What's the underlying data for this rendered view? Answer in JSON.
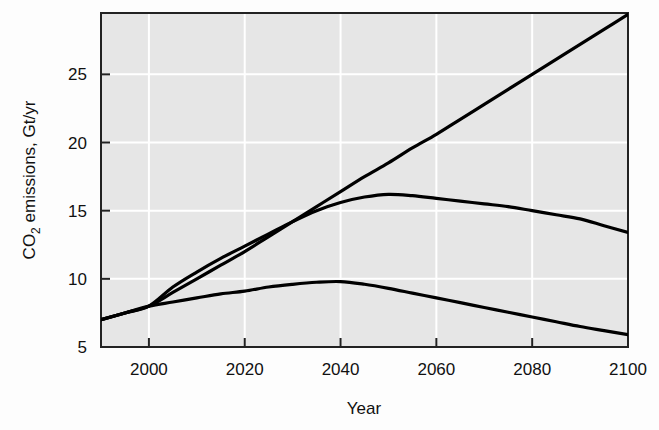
{
  "chart_data": {
    "type": "line",
    "title": "",
    "xlabel": "Year",
    "ylabel": "CO2 emissions, Gt/yr",
    "ylabel_parts": {
      "prefix": "CO",
      "subscript": "2",
      "suffix": " emissions, Gt/yr"
    },
    "xlim": [
      1990,
      2100
    ],
    "ylim": [
      5,
      29.5
    ],
    "xticks": [
      2000,
      2020,
      2040,
      2060,
      2080,
      2100
    ],
    "yticks": [
      5,
      10,
      15,
      20,
      25
    ],
    "xtick_labels": [
      "2000",
      "2020",
      "2040",
      "2060",
      "2080",
      "2100"
    ],
    "ytick_labels": [
      "5",
      "10",
      "15",
      "20",
      "25"
    ],
    "grid": true,
    "grid_color": "#ffffff",
    "plot_background": "#e6e6e6",
    "line_color": "#000000",
    "legend": "none",
    "x": [
      1990,
      1995,
      2000,
      2005,
      2010,
      2015,
      2020,
      2025,
      2030,
      2035,
      2040,
      2045,
      2050,
      2055,
      2060,
      2065,
      2070,
      2075,
      2080,
      2085,
      2090,
      2095,
      2100
    ],
    "series": [
      {
        "name": "high-growth scenario",
        "values": [
          7.0,
          7.5,
          8.0,
          9.0,
          10.0,
          11.0,
          12.0,
          13.1,
          14.2,
          15.3,
          16.4,
          17.5,
          18.5,
          19.6,
          20.6,
          21.7,
          22.8,
          23.9,
          25.0,
          26.1,
          27.2,
          28.3,
          29.4
        ]
      },
      {
        "name": "middle stabilization scenario",
        "values": [
          7.0,
          7.5,
          8.0,
          9.4,
          10.5,
          11.5,
          12.4,
          13.3,
          14.2,
          15.0,
          15.6,
          16.0,
          16.2,
          16.1,
          15.9,
          15.7,
          15.5,
          15.3,
          15.0,
          14.7,
          14.4,
          13.9,
          13.4
        ]
      },
      {
        "name": "low mitigation scenario",
        "values": [
          7.0,
          7.5,
          8.0,
          8.3,
          8.6,
          8.9,
          9.1,
          9.4,
          9.6,
          9.75,
          9.8,
          9.6,
          9.3,
          8.95,
          8.6,
          8.25,
          7.9,
          7.55,
          7.2,
          6.85,
          6.5,
          6.2,
          5.9
        ]
      }
    ]
  },
  "axis": {
    "xlabel": "Year"
  }
}
